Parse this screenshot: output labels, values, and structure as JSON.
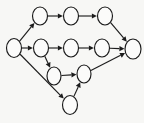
{
  "figure": {
    "name": "directed-acyclic-graph-diagram",
    "type": "node-link-diagram",
    "background_color": "#f7f7f5",
    "stroke_color": "#1c1c1c",
    "node_fill_color": "#fbfbfa",
    "node_count": 11,
    "edge_count": 13,
    "node_shape": "ellipse",
    "node_labels_visible": false,
    "edge_labels_visible": false,
    "edge_style": "straight-line-with-solid-triangular-arrowhead"
  },
  "nodes": [
    {
      "id": "n0",
      "name": "node-source",
      "cx": 14,
      "cy": 48,
      "rx": 7.5,
      "ry": 9.5,
      "label": ""
    },
    {
      "id": "n1",
      "name": "node-top-1",
      "cx": 40,
      "cy": 16,
      "rx": 7.5,
      "ry": 9.0,
      "label": ""
    },
    {
      "id": "n2",
      "name": "node-top-2",
      "cx": 71,
      "cy": 16,
      "rx": 7.5,
      "ry": 9.0,
      "label": ""
    },
    {
      "id": "n3",
      "name": "node-top-3",
      "cx": 105,
      "cy": 16,
      "rx": 7.5,
      "ry": 9.0,
      "label": ""
    },
    {
      "id": "n4",
      "name": "node-middle-1",
      "cx": 41,
      "cy": 48,
      "rx": 7.5,
      "ry": 9.0,
      "label": ""
    },
    {
      "id": "n5",
      "name": "node-middle-2",
      "cx": 71,
      "cy": 48,
      "rx": 7.5,
      "ry": 9.0,
      "label": ""
    },
    {
      "id": "n6",
      "name": "node-middle-3",
      "cx": 102,
      "cy": 48,
      "rx": 7.5,
      "ry": 9.0,
      "label": ""
    },
    {
      "id": "n7",
      "name": "node-sink",
      "cx": 133,
      "cy": 49,
      "rx": 8.0,
      "ry": 10.0,
      "label": ""
    },
    {
      "id": "n8",
      "name": "node-lower-1",
      "cx": 54,
      "cy": 76,
      "rx": 7.0,
      "ry": 9.0,
      "label": ""
    },
    {
      "id": "n9",
      "name": "node-lower-2",
      "cx": 84,
      "cy": 74,
      "rx": 7.0,
      "ry": 9.0,
      "label": ""
    },
    {
      "id": "n10",
      "name": "node-bottom",
      "cx": 70,
      "cy": 105,
      "rx": 7.5,
      "ry": 9.5,
      "label": ""
    }
  ],
  "edges": [
    {
      "name": "edge-source-to-top-1",
      "from": "n0",
      "to": "n1",
      "label": ""
    },
    {
      "name": "edge-source-to-middle-1",
      "from": "n0",
      "to": "n4",
      "label": ""
    },
    {
      "name": "edge-source-to-bottom",
      "from": "n0",
      "to": "n10",
      "label": ""
    },
    {
      "name": "edge-top-1-to-top-2",
      "from": "n1",
      "to": "n2",
      "label": ""
    },
    {
      "name": "edge-top-2-to-top-3",
      "from": "n2",
      "to": "n3",
      "label": ""
    },
    {
      "name": "edge-top-3-to-sink",
      "from": "n3",
      "to": "n7",
      "label": ""
    },
    {
      "name": "edge-middle-1-to-middle-2",
      "from": "n4",
      "to": "n5",
      "label": ""
    },
    {
      "name": "edge-middle-1-to-lower-1",
      "from": "n4",
      "to": "n8",
      "label": ""
    },
    {
      "name": "edge-middle-2-to-middle-3",
      "from": "n5",
      "to": "n6",
      "label": ""
    },
    {
      "name": "edge-middle-3-to-sink",
      "from": "n6",
      "to": "n7",
      "label": ""
    },
    {
      "name": "edge-lower-1-to-lower-2",
      "from": "n8",
      "to": "n9",
      "label": ""
    },
    {
      "name": "edge-bottom-to-lower-2",
      "from": "n10",
      "to": "n9",
      "label": ""
    },
    {
      "name": "edge-lower-2-to-sink",
      "from": "n9",
      "to": "n7",
      "label": ""
    }
  ]
}
